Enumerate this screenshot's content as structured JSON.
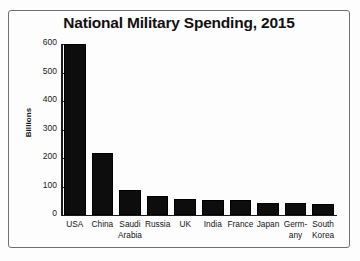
{
  "chart_data": {
    "type": "bar",
    "title": "National Military Spending, 2015",
    "xlabel": "",
    "ylabel": "Billions",
    "ylim": [
      0,
      600
    ],
    "yticks": [
      0,
      100,
      200,
      300,
      400,
      500,
      600
    ],
    "ytick_labels": [
      "0",
      "100",
      "200",
      "300",
      "400",
      "500",
      "600"
    ],
    "grid": false,
    "legend": false,
    "bar_color": "#0d0d0d",
    "categories": [
      "USA",
      "China",
      "Saudi Arabia",
      "Russia",
      "UK",
      "India",
      "France",
      "Japan",
      "Germany",
      "South Korea"
    ],
    "category_label_lines": [
      [
        "USA",
        ""
      ],
      [
        "China",
        ""
      ],
      [
        "Saudi",
        "Arabia"
      ],
      [
        "Russia",
        ""
      ],
      [
        "UK",
        ""
      ],
      [
        "India",
        ""
      ],
      [
        "France",
        ""
      ],
      [
        "Japan",
        ""
      ],
      [
        "Germ-",
        "any"
      ],
      [
        "South",
        "Korea"
      ]
    ],
    "values": [
      598,
      215,
      87,
      66,
      56,
      51,
      51,
      41,
      39,
      36
    ]
  }
}
